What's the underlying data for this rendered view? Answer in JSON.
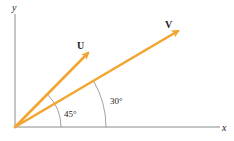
{
  "diagram": {
    "axes": {
      "x_label": "x",
      "y_label": "y",
      "color": "#8a8a8a"
    },
    "vectors": [
      {
        "name": "U",
        "angle_deg": 45,
        "color": "#f2a531"
      },
      {
        "name": "V",
        "angle_deg": 30,
        "color": "#f2a531"
      }
    ],
    "angles": [
      {
        "label": "45°",
        "between": [
          "x-axis",
          "U"
        ]
      },
      {
        "label": "30°",
        "between": [
          "x-axis",
          "V"
        ]
      }
    ]
  }
}
